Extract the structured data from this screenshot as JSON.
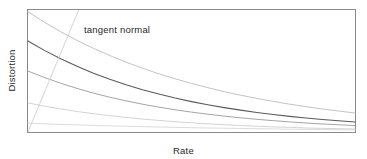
{
  "figure": {
    "background_color": "#ffffff",
    "frame_color": "#8a8a8a",
    "annotation_label": "tangent normal"
  },
  "chart_data": {
    "type": "line",
    "title": "",
    "subtitle": "",
    "xlabel": "Rate",
    "ylabel": "Distortion",
    "xlim": [
      0,
      1
    ],
    "ylim": [
      0,
      1
    ],
    "grid": false,
    "legend": "none",
    "xticks": [],
    "yticks": [],
    "xticklabels": [],
    "yticklabels": [],
    "annotations": [
      {
        "text": "tangent normal",
        "x": 0.17,
        "y": 0.86,
        "describes": "straight tangent line crossing the family of distortion curves"
      }
    ],
    "x": [
      0,
      0.05,
      0.1,
      0.15,
      0.2,
      0.25,
      0.3,
      0.35,
      0.4,
      0.45,
      0.5,
      0.55,
      0.6,
      0.65,
      0.7,
      0.75,
      0.8,
      0.85,
      0.9,
      0.95,
      1
    ],
    "series": [
      {
        "name": "curve-1",
        "style": "solid",
        "color": "#b4b4b4",
        "linewidth": 0.8,
        "y0": 0.985,
        "values": [
          0.985,
          0.9,
          0.822,
          0.751,
          0.686,
          0.627,
          0.572,
          0.523,
          0.477,
          0.436,
          0.398,
          0.363,
          0.331,
          0.302,
          0.275,
          0.251,
          0.228,
          0.208,
          0.189,
          0.172,
          0.156
        ]
      },
      {
        "name": "curve-2",
        "style": "solid",
        "color": "#5a5a5a",
        "linewidth": 1.1,
        "y0": 0.746,
        "values": [
          0.746,
          0.669,
          0.6,
          0.538,
          0.482,
          0.432,
          0.387,
          0.347,
          0.311,
          0.278,
          0.249,
          0.223,
          0.2,
          0.179,
          0.16,
          0.143,
          0.128,
          0.115,
          0.103,
          0.092,
          0.082
        ]
      },
      {
        "name": "curve-3",
        "style": "solid",
        "color": "#9a9a9a",
        "linewidth": 0.9,
        "y0": 0.5,
        "values": [
          0.5,
          0.447,
          0.4,
          0.357,
          0.319,
          0.285,
          0.255,
          0.228,
          0.204,
          0.182,
          0.163,
          0.146,
          0.13,
          0.116,
          0.104,
          0.093,
          0.083,
          0.074,
          0.066,
          0.059,
          0.053
        ]
      },
      {
        "name": "curve-4",
        "style": "solid",
        "color": "#c8c8c8",
        "linewidth": 0.8,
        "y0": 0.238,
        "values": [
          0.238,
          0.212,
          0.189,
          0.168,
          0.15,
          0.134,
          0.119,
          0.106,
          0.095,
          0.084,
          0.075,
          0.067,
          0.06,
          0.053,
          0.047,
          0.042,
          0.038,
          0.033,
          0.03,
          0.027,
          0.024
        ]
      },
      {
        "name": "curve-5",
        "style": "solid",
        "color": "#d2d2d2",
        "linewidth": 0.8,
        "y0": 0.072,
        "values": [
          0.072,
          0.067,
          0.062,
          0.058,
          0.054,
          0.05,
          0.047,
          0.044,
          0.041,
          0.038,
          0.035,
          0.033,
          0.031,
          0.029,
          0.027,
          0.025,
          0.023,
          0.022,
          0.02,
          0.019,
          0.018
        ]
      }
    ],
    "tangent_line": {
      "name": "tangent-normal-line",
      "color": "#cfcfcf",
      "linewidth": 0.9,
      "x_start": 0.155,
      "y_start": 1.0,
      "x_end": 0.0,
      "y_end": 0.0
    }
  }
}
